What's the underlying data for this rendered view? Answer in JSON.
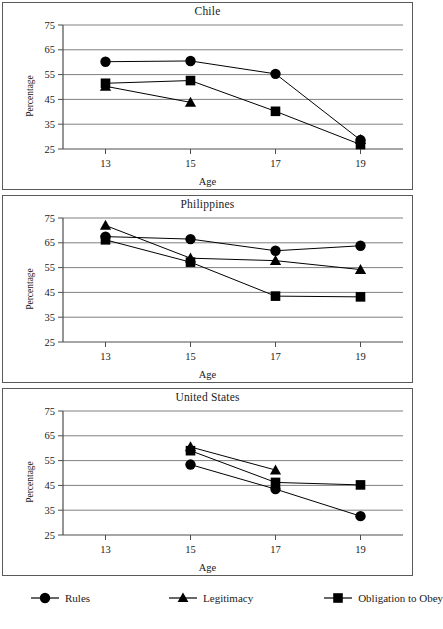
{
  "figure": {
    "ylabel": "Percentage",
    "xlabel": "Age",
    "y_ticks": [
      "75",
      "65",
      "55",
      "45",
      "35",
      "25"
    ],
    "x_ticks": [
      "13",
      "15",
      "17",
      "19"
    ],
    "marker_color": "#000000",
    "gridline_color": "#808080",
    "axis_color": "#4d4d4d"
  },
  "legend": {
    "items": [
      {
        "label": "Rules",
        "marker": "circle",
        "icon": "circle-marker-icon"
      },
      {
        "label": "Legitimacy",
        "marker": "triangle",
        "icon": "triangle-marker-icon"
      },
      {
        "label": "Obligation to Obey",
        "marker": "square",
        "icon": "square-marker-icon"
      }
    ]
  },
  "chart_data": [
    {
      "type": "line",
      "title": "Chile",
      "xlabel": "Age",
      "ylabel": "Percentage",
      "categories": [
        13,
        15,
        17,
        19
      ],
      "xlim": [
        12,
        20
      ],
      "ylim": [
        25,
        75
      ],
      "grid": true,
      "legend_position": "bottom",
      "series": [
        {
          "name": "Rules",
          "marker": "circle",
          "values": [
            60.2,
            60.5,
            55.3,
            28.6
          ]
        },
        {
          "name": "Legitimacy",
          "marker": "triangle",
          "values": [
            50.3,
            43.8,
            null,
            28.8
          ]
        },
        {
          "name": "Obligation to Obey",
          "marker": "square",
          "values": [
            51.5,
            52.6,
            40.2,
            26.8
          ]
        }
      ]
    },
    {
      "type": "line",
      "title": "Philippines",
      "xlabel": "Age",
      "ylabel": "Percentage",
      "categories": [
        13,
        15,
        17,
        19
      ],
      "xlim": [
        12,
        20
      ],
      "ylim": [
        25,
        75
      ],
      "grid": true,
      "legend_position": "bottom",
      "series": [
        {
          "name": "Rules",
          "marker": "circle",
          "values": [
            67.5,
            66.5,
            61.8,
            63.8
          ]
        },
        {
          "name": "Legitimacy",
          "marker": "triangle",
          "values": [
            72.0,
            58.8,
            57.8,
            54.2
          ]
        },
        {
          "name": "Obligation to Obey",
          "marker": "square",
          "values": [
            66.2,
            57.2,
            43.5,
            43.2
          ]
        }
      ]
    },
    {
      "type": "line",
      "title": "United States",
      "xlabel": "Age",
      "ylabel": "Percentage",
      "categories": [
        13,
        15,
        17,
        19
      ],
      "xlim": [
        12,
        20
      ],
      "ylim": [
        25,
        75
      ],
      "grid": true,
      "legend_position": "bottom",
      "series": [
        {
          "name": "Rules",
          "marker": "circle",
          "values": [
            null,
            53.4,
            43.5,
            32.6
          ]
        },
        {
          "name": "Legitimacy",
          "marker": "triangle",
          "values": [
            null,
            60.5,
            51.2,
            null
          ]
        },
        {
          "name": "Obligation to Obey",
          "marker": "square",
          "values": [
            null,
            59.0,
            46.2,
            45.2
          ]
        }
      ]
    }
  ]
}
